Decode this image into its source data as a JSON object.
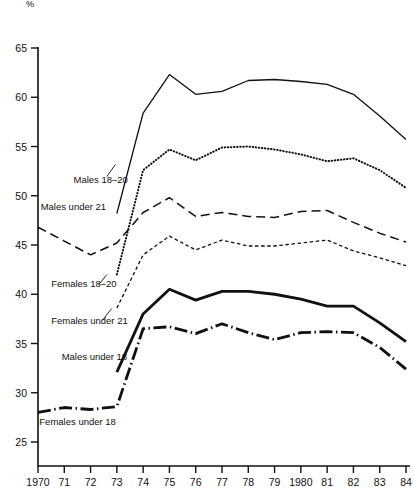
{
  "chart_data": {
    "type": "line",
    "title": "",
    "subtitle": "",
    "xlabel": "",
    "ylabel": "%",
    "ylim": [
      25,
      65
    ],
    "xlim": [
      1970,
      1984
    ],
    "ytick_labels": [
      "65",
      "60",
      "55",
      "50",
      "45",
      "40",
      "35",
      "30",
      "25"
    ],
    "ytick_values": [
      65,
      60,
      55,
      50,
      45,
      40,
      35,
      30,
      25
    ],
    "xtick_labels": [
      "1970",
      "71",
      "72",
      "73",
      "74",
      "75",
      "76",
      "77",
      "78",
      "79",
      "1980",
      "81",
      "82",
      "83",
      "84"
    ],
    "x": [
      1970,
      1971,
      1972,
      1973,
      1974,
      1975,
      1976,
      1977,
      1978,
      1979,
      1980,
      1981,
      1982,
      1983,
      1984
    ],
    "grid": false,
    "legend_position": "inline-annotations",
    "series": [
      {
        "name": "Males 18-20",
        "label": "Males 18–20",
        "style": "solid-thin",
        "label_x": 1971.35,
        "label_y": 51.6,
        "values": [
          null,
          null,
          null,
          48.2,
          58.4,
          62.3,
          60.3,
          60.6,
          61.7,
          61.8,
          61.6,
          61.3,
          60.3,
          58.1,
          55.7
        ]
      },
      {
        "name": "Males under 21",
        "label": "Males under 21",
        "style": "dotted-coarse",
        "label_x": 1970.1,
        "label_y": 48.9,
        "values": [
          null,
          null,
          null,
          42.0,
          52.6,
          54.7,
          53.6,
          54.9,
          55.0,
          54.7,
          54.2,
          53.5,
          53.8,
          52.6,
          50.8
        ]
      },
      {
        "name": "Females 18-20",
        "label": "Females 18–20",
        "style": "dashed-long",
        "label_x": 1970.5,
        "label_y": 41.0,
        "values": [
          46.8,
          45.4,
          44.0,
          45.2,
          48.3,
          49.8,
          47.9,
          48.3,
          47.9,
          47.8,
          48.4,
          48.5,
          47.3,
          46.2,
          45.3
        ]
      },
      {
        "name": "Females under 21",
        "label": "Females under 21",
        "style": "dashed-fine",
        "label_x": 1970.5,
        "label_y": 37.3,
        "values": [
          null,
          null,
          null,
          38.6,
          44.0,
          45.9,
          44.5,
          45.5,
          44.9,
          44.9,
          45.2,
          45.5,
          44.4,
          43.7,
          42.9
        ]
      },
      {
        "name": "Males under 18",
        "label": "Males under 18",
        "style": "solid-thick",
        "label_x": 1970.9,
        "label_y": 33.6,
        "values": [
          null,
          null,
          null,
          32.1,
          38.0,
          40.5,
          39.4,
          40.3,
          40.3,
          40.0,
          39.5,
          38.8,
          38.8,
          37.1,
          35.2
        ]
      },
      {
        "name": "Females under 18",
        "label": "Females under 18",
        "style": "dash-dot-thick",
        "label_x": 1970.05,
        "label_y": 27.0,
        "values": [
          28.0,
          28.5,
          28.3,
          28.6,
          36.5,
          36.7,
          36.0,
          37.0,
          36.1,
          35.4,
          36.1,
          36.2,
          36.1,
          34.6,
          32.4
        ]
      }
    ]
  }
}
